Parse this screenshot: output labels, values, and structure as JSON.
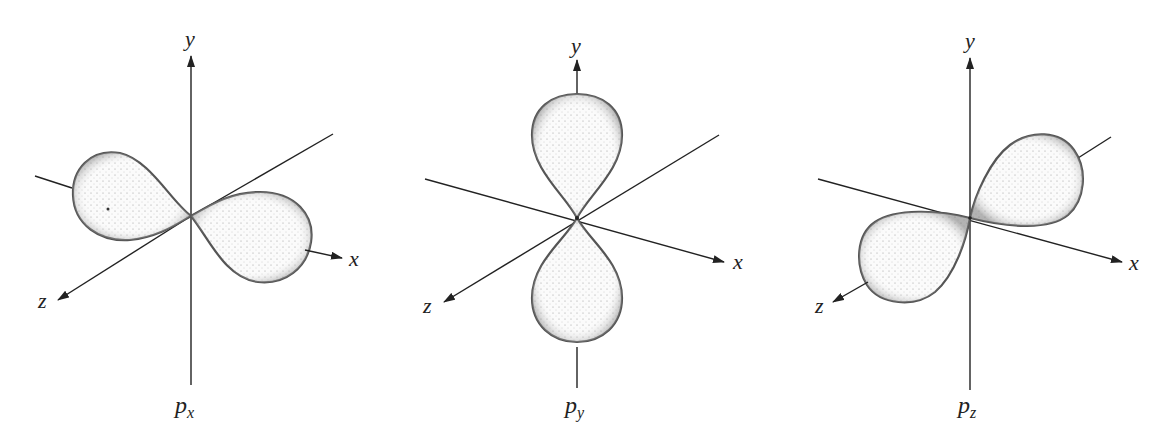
{
  "figure": {
    "panels": [
      {
        "id": "px",
        "caption_main": "p",
        "caption_sub": "x",
        "axis_labels": {
          "x": "x",
          "y": "y",
          "z": "z"
        },
        "lobe_orientation": "along x-axis"
      },
      {
        "id": "py",
        "caption_main": "p",
        "caption_sub": "y",
        "axis_labels": {
          "x": "x",
          "y": "y",
          "z": "z"
        },
        "lobe_orientation": "along y-axis"
      },
      {
        "id": "pz",
        "caption_main": "p",
        "caption_sub": "z",
        "axis_labels": {
          "x": "x",
          "y": "y",
          "z": "z"
        },
        "lobe_orientation": "along z-axis"
      }
    ],
    "colors": {
      "line": "#222222",
      "lobe_edge": "#555555",
      "background": "#ffffff"
    }
  }
}
